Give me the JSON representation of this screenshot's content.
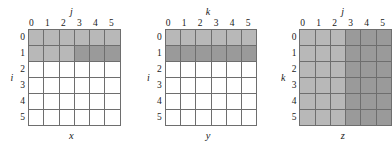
{
  "figure": {
    "cell_colors": {
      "white": "#ffffff",
      "light_gray": "#b8b8b8",
      "dark_gray": "#9a9a9a",
      "grid_line": "#6e6e6e"
    },
    "matrices": [
      {
        "name": "x",
        "col_axis_label": "j",
        "row_axis_label": "i",
        "col_headers": [
          "0",
          "1",
          "2",
          "3",
          "4",
          "5"
        ],
        "row_headers": [
          "0",
          "1",
          "2",
          "3",
          "4",
          "5"
        ],
        "cells": [
          [
            "light",
            "light",
            "light",
            "light",
            "light",
            "light"
          ],
          [
            "light",
            "light",
            "light",
            "dark",
            "dark",
            "dark"
          ],
          [
            "white",
            "white",
            "white",
            "white",
            "white",
            "white"
          ],
          [
            "white",
            "white",
            "white",
            "white",
            "white",
            "white"
          ],
          [
            "white",
            "white",
            "white",
            "white",
            "white",
            "white"
          ],
          [
            "white",
            "white",
            "white",
            "white",
            "white",
            "white"
          ]
        ]
      },
      {
        "name": "y",
        "col_axis_label": "k",
        "row_axis_label": "i",
        "col_headers": [
          "0",
          "1",
          "2",
          "3",
          "4",
          "5"
        ],
        "row_headers": [
          "0",
          "1",
          "2",
          "3",
          "4",
          "5"
        ],
        "cells": [
          [
            "light",
            "light",
            "light",
            "light",
            "light",
            "light"
          ],
          [
            "dark",
            "dark",
            "dark",
            "dark",
            "dark",
            "dark"
          ],
          [
            "white",
            "white",
            "white",
            "white",
            "white",
            "white"
          ],
          [
            "white",
            "white",
            "white",
            "white",
            "white",
            "white"
          ],
          [
            "white",
            "white",
            "white",
            "white",
            "white",
            "white"
          ],
          [
            "white",
            "white",
            "white",
            "white",
            "white",
            "white"
          ]
        ]
      },
      {
        "name": "z",
        "col_axis_label": "j",
        "row_axis_label": "k",
        "col_headers": [
          "0",
          "1",
          "2",
          "3",
          "4",
          "5"
        ],
        "row_headers": [
          "0",
          "1",
          "2",
          "3",
          "4",
          "5"
        ],
        "cells": [
          [
            "light",
            "light",
            "light",
            "dark",
            "dark",
            "dark"
          ],
          [
            "light",
            "light",
            "light",
            "dark",
            "dark",
            "dark"
          ],
          [
            "light",
            "light",
            "light",
            "dark",
            "dark",
            "dark"
          ],
          [
            "light",
            "light",
            "light",
            "dark",
            "dark",
            "dark"
          ],
          [
            "light",
            "light",
            "light",
            "dark",
            "dark",
            "dark"
          ],
          [
            "light",
            "light",
            "light",
            "dark",
            "dark",
            "dark"
          ]
        ]
      }
    ]
  }
}
